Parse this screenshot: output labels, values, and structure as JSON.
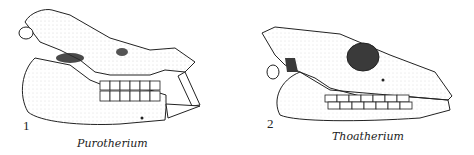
{
  "figures": [
    {
      "number": "1",
      "caption": "Purotherium"
    },
    {
      "number": "2",
      "caption": "Thoatherium"
    }
  ],
  "colors": {
    "ink": "#222222",
    "shade": "#6b6b6b",
    "dark": "#2a2a2a",
    "paper": "#ffffff"
  }
}
